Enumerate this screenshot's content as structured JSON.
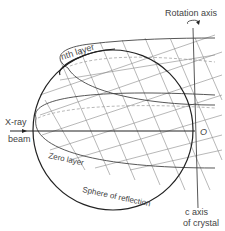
{
  "figure": {
    "labels": {
      "rotation_axis": "Rotation axis",
      "nth_layer": "nth layer",
      "xray_line1": "X-ray",
      "xray_line2": "beam",
      "origin": "O",
      "zero_layer": "Zero layer",
      "sphere": "Sphere of reflection",
      "c_axis_line1": "c axis",
      "c_axis_line2": "of crystal"
    },
    "colors": {
      "ink": "#222222",
      "grid": "#888888",
      "background": "#ffffff"
    }
  }
}
